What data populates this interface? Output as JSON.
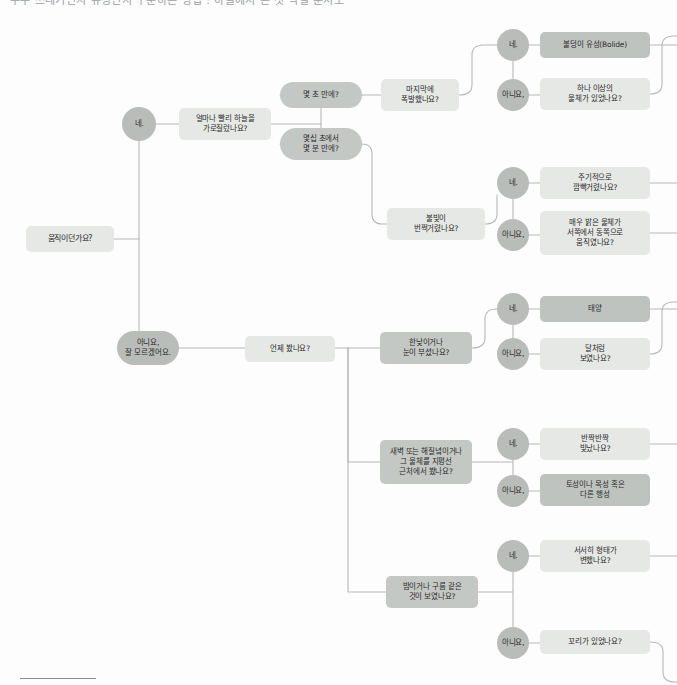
{
  "page": {
    "title_strip": "우주 쓰레기인지 유성인지 구분하는 방법 : 하늘에서 본 것 식별 순서도",
    "background": "#fdfdfd",
    "footer_rule": true
  },
  "palette": {
    "root_fill": "#d9dcd9",
    "question_light": "#e6e8e6",
    "question_mid": "#c4c8c5",
    "answer_circle": "#b9bdba",
    "answer_circle_dark": "#aeb2af",
    "terminal_fill": "#bfc3c0",
    "link_stroke": "#b6bab7",
    "text": "#2b2b2b"
  },
  "chart_data": {
    "type": "diagram",
    "subtype": "decision-flowchart",
    "orientation": "left-to-right",
    "title": "하늘에서 본 것 식별 순서도"
  },
  "nodes": [
    {
      "id": "root",
      "label": "움직이던가요?",
      "shape": "rect",
      "fill": "question_light",
      "x": 26,
      "y": 226,
      "w": 88,
      "h": 26,
      "fs": 8
    },
    {
      "id": "yes1",
      "label": "네.",
      "shape": "circ",
      "fill": "answer_circle",
      "x": 122,
      "y": 107,
      "w": 34,
      "h": 34,
      "fs": 7.5
    },
    {
      "id": "no1",
      "label": "아니요,\n잘 모르겠어요.",
      "shape": "pill",
      "fill": "answer_circle",
      "x": 117,
      "y": 331,
      "w": 62,
      "h": 34,
      "fs": 7.5
    },
    {
      "id": "q_speed",
      "label": "얼마나 빨리 하늘을\n가로질렀나요?",
      "shape": "rect",
      "fill": "question_light",
      "x": 179,
      "y": 108,
      "w": 92,
      "h": 32,
      "fs": 7.5
    },
    {
      "id": "a_seconds",
      "label": "몇 초 만에?",
      "shape": "pill",
      "fill": "question_mid",
      "x": 280,
      "y": 82,
      "w": 82,
      "h": 26,
      "fs": 7.5
    },
    {
      "id": "a_minutes",
      "label": "몇십 초에서\n몇 분 만에?",
      "shape": "pill",
      "fill": "question_mid",
      "x": 280,
      "y": 128,
      "w": 82,
      "h": 32,
      "fs": 7.5
    },
    {
      "id": "q_explode",
      "label": "마지막에\n폭발했나요?",
      "shape": "rect",
      "fill": "question_light",
      "x": 381,
      "y": 79,
      "w": 78,
      "h": 32,
      "fs": 7.5
    },
    {
      "id": "yes2",
      "label": "네.",
      "shape": "circ",
      "fill": "answer_circle",
      "x": 497,
      "y": 29,
      "w": 32,
      "h": 32,
      "fs": 7.5
    },
    {
      "id": "no2",
      "label": "아니요,",
      "shape": "circ",
      "fill": "answer_circle",
      "x": 497,
      "y": 79,
      "w": 32,
      "h": 32,
      "fs": 7.5
    },
    {
      "id": "t_bolide",
      "label": "불덩이 유성(Bolide)",
      "shape": "rect",
      "fill": "terminal_fill",
      "x": 540,
      "y": 32,
      "w": 110,
      "h": 26,
      "fs": 7.5
    },
    {
      "id": "q_multi",
      "label": "하나 이상의\n물체가 있었나요?",
      "shape": "rect",
      "fill": "question_light",
      "x": 540,
      "y": 78,
      "w": 110,
      "h": 32,
      "fs": 7.5
    },
    {
      "id": "q_flash",
      "label": "불빛이\n번쩍거렸나요?",
      "shape": "rect",
      "fill": "question_light",
      "x": 387,
      "y": 208,
      "w": 98,
      "h": 32,
      "fs": 7.5
    },
    {
      "id": "yes3",
      "label": "네.",
      "shape": "circ",
      "fill": "answer_circle",
      "x": 497,
      "y": 167,
      "w": 32,
      "h": 32,
      "fs": 7.5
    },
    {
      "id": "no3",
      "label": "아니요,",
      "shape": "circ",
      "fill": "answer_circle",
      "x": 497,
      "y": 219,
      "w": 32,
      "h": 32,
      "fs": 7.5
    },
    {
      "id": "q_periodic",
      "label": "주기적으로\n깜빡거렸나요?",
      "shape": "rect",
      "fill": "question_light",
      "x": 540,
      "y": 167,
      "w": 110,
      "h": 32,
      "fs": 7.5
    },
    {
      "id": "q_westeast",
      "label": "매우 밝은 물체가\n서쪽에서 동쪽으로\n움직였나요?",
      "shape": "rect",
      "fill": "question_light",
      "x": 540,
      "y": 211,
      "w": 110,
      "h": 44,
      "fs": 7.5
    },
    {
      "id": "q_when",
      "label": "언제 봤나요?",
      "shape": "rect",
      "fill": "question_light",
      "x": 245,
      "y": 336,
      "w": 90,
      "h": 26,
      "fs": 7.5
    },
    {
      "id": "q_daylight",
      "label": "한낮이거나\n눈이 부셨나요?",
      "shape": "rect",
      "fill": "question_mid",
      "x": 380,
      "y": 332,
      "w": 92,
      "h": 32,
      "fs": 7.5
    },
    {
      "id": "yes4",
      "label": "네.",
      "shape": "circ",
      "fill": "answer_circle",
      "x": 497,
      "y": 293,
      "w": 32,
      "h": 32,
      "fs": 7.5
    },
    {
      "id": "no4",
      "label": "아니요,",
      "shape": "circ",
      "fill": "answer_circle",
      "x": 497,
      "y": 338,
      "w": 32,
      "h": 32,
      "fs": 7.5
    },
    {
      "id": "t_sun",
      "label": "태양",
      "shape": "rect",
      "fill": "terminal_fill",
      "x": 540,
      "y": 296,
      "w": 110,
      "h": 26,
      "fs": 7.5
    },
    {
      "id": "q_moonlike",
      "label": "달처럼\n보였나요?",
      "shape": "rect",
      "fill": "question_light",
      "x": 540,
      "y": 338,
      "w": 110,
      "h": 32,
      "fs": 7.5
    },
    {
      "id": "q_horizon",
      "label": "새벽 또는 해질녘이거나\n그 물체를 지평선\n근처에서 봤나요?",
      "shape": "rect",
      "fill": "question_mid",
      "x": 380,
      "y": 440,
      "w": 92,
      "h": 44,
      "fs": 7.5
    },
    {
      "id": "yes5",
      "label": "네.",
      "shape": "circ",
      "fill": "answer_circle",
      "x": 497,
      "y": 428,
      "w": 32,
      "h": 32,
      "fs": 7.5
    },
    {
      "id": "no5",
      "label": "아니요,",
      "shape": "circ",
      "fill": "answer_circle",
      "x": 497,
      "y": 475,
      "w": 32,
      "h": 32,
      "fs": 7.5
    },
    {
      "id": "q_twinkle",
      "label": "반짝반짝\n빛났나요?",
      "shape": "rect",
      "fill": "question_light",
      "x": 540,
      "y": 428,
      "w": 110,
      "h": 32,
      "fs": 7.5
    },
    {
      "id": "t_planet",
      "label": "토성이나 목성 혹은\n다른 행성",
      "shape": "rect",
      "fill": "terminal_fill",
      "x": 540,
      "y": 474,
      "w": 110,
      "h": 32,
      "fs": 7.5
    },
    {
      "id": "q_cloud",
      "label": "밤이거나 구름 같은\n것이 보였나요?",
      "shape": "rect",
      "fill": "question_mid",
      "x": 386,
      "y": 576,
      "w": 92,
      "h": 32,
      "fs": 7.5
    },
    {
      "id": "yes6",
      "label": "네.",
      "shape": "circ",
      "fill": "answer_circle",
      "x": 497,
      "y": 540,
      "w": 32,
      "h": 32,
      "fs": 7.5
    },
    {
      "id": "no6",
      "label": "아니요,",
      "shape": "circ",
      "fill": "answer_circle",
      "x": 497,
      "y": 627,
      "w": 32,
      "h": 32,
      "fs": 7.5
    },
    {
      "id": "q_shape",
      "label": "서서히 형태가\n변했나요?",
      "shape": "rect",
      "fill": "question_light",
      "x": 540,
      "y": 540,
      "w": 110,
      "h": 32,
      "fs": 7.5
    },
    {
      "id": "q_tail",
      "label": "꼬리가 있었나요?",
      "shape": "rect",
      "fill": "question_light",
      "x": 540,
      "y": 630,
      "w": 110,
      "h": 24,
      "fs": 7.5
    }
  ],
  "edges": [
    {
      "from": "root",
      "to": "yes1",
      "path": "M114,239 L139,239 L139,141"
    },
    {
      "from": "root",
      "to": "no1",
      "path": "M139,239 L139,331"
    },
    {
      "from": "yes1",
      "to": "q_speed",
      "path": "M156,124 L179,124"
    },
    {
      "from": "q_speed",
      "to": "trunk1",
      "path": "M271,124 L321,124"
    },
    {
      "from": "trunk1",
      "to": "a_seconds",
      "path": "M321,124 L321,95 L362,95 M321,95 L280,95"
    },
    {
      "from": "trunk1",
      "to": "a_minutes",
      "path": "M321,124 L321,144 L280,144"
    },
    {
      "from": "a_seconds",
      "to": "q_explode",
      "path": "M362,95 L381,95"
    },
    {
      "from": "a_minutes",
      "to": "q_flash",
      "path": "M362,144 Q372,144 372,154 L372,214 Q372,224 382,224 L387,224"
    },
    {
      "from": "q_explode",
      "to": "ans2",
      "path": "M459,95 Q472,95 472,85 L472,55 Q472,45 484,45 L497,45 M513,61 L513,79"
    },
    {
      "from": "yes2",
      "to": "t_bolide",
      "path": "M529,45 L540,45"
    },
    {
      "from": "no2",
      "to": "q_multi",
      "path": "M529,95 L540,95"
    },
    {
      "from": "t_bolide",
      "to": "right1",
      "path": "M650,45 L677,45"
    },
    {
      "from": "q_multi",
      "to": "right2",
      "path": "M650,94 Q662,94 662,84 L662,46 Q662,36 674,36 L677,36"
    },
    {
      "from": "q_flash",
      "to": "ans3",
      "path": "M485,224 Q497,224 497,214 L497,195 M513,199 L513,219"
    },
    {
      "from": "yes3",
      "to": "q_periodic",
      "path": "M529,183 L540,183"
    },
    {
      "from": "no3",
      "to": "q_westeast",
      "path": "M529,235 L540,235"
    },
    {
      "from": "q_periodic",
      "to": "right3",
      "path": "M650,183 L677,183"
    },
    {
      "from": "q_westeast",
      "to": "right4",
      "path": "M650,233 L677,233"
    },
    {
      "from": "no1",
      "to": "q_when",
      "path": "M179,348 L245,348"
    },
    {
      "from": "q_when",
      "to": "trunk2",
      "path": "M335,348 L348,348"
    },
    {
      "from": "trunk2",
      "to": "q_daylight",
      "path": "M348,348 L380,348"
    },
    {
      "from": "trunk2",
      "to": "q_horizon",
      "path": "M348,348 L348,462 L380,462"
    },
    {
      "from": "trunk2",
      "to": "q_cloud",
      "path": "M348,348 L348,592 L386,592"
    },
    {
      "from": "q_daylight",
      "to": "ans4",
      "path": "M472,348 Q485,348 485,338 L485,319 Q485,309 497,309 M513,325 L513,338"
    },
    {
      "from": "yes4",
      "to": "t_sun",
      "path": "M529,309 L540,309"
    },
    {
      "from": "no4",
      "to": "q_moonlike",
      "path": "M529,354 L540,354"
    },
    {
      "from": "t_sun",
      "to": "right5",
      "path": "M650,309 L677,309"
    },
    {
      "from": "q_moonlike",
      "to": "right6",
      "path": "M650,354 Q662,354 662,344 L662,312 Q662,302 674,302 L677,302"
    },
    {
      "from": "q_horizon",
      "to": "ans5",
      "path": "M472,462 L513,462 M513,444 L513,491"
    },
    {
      "from": "yes5",
      "to": "q_twinkle",
      "path": "M529,444 L540,444"
    },
    {
      "from": "no5",
      "to": "t_planet",
      "path": "M529,491 L540,491"
    },
    {
      "from": "q_twinkle",
      "to": "right7",
      "path": "M650,444 L677,444"
    },
    {
      "from": "q_cloud",
      "to": "ans6",
      "path": "M478,592 L513,592 M513,572 L513,627"
    },
    {
      "from": "yes6",
      "to": "q_shape",
      "path": "M529,556 L540,556"
    },
    {
      "from": "no6",
      "to": "q_tail",
      "path": "M529,643 L540,643"
    },
    {
      "from": "q_shape",
      "to": "right8",
      "path": "M650,556 L677,556"
    },
    {
      "from": "q_tail",
      "to": "right9",
      "path": "M650,642 Q663,642 663,652 L663,672 Q663,682 675,682 L677,682"
    }
  ]
}
